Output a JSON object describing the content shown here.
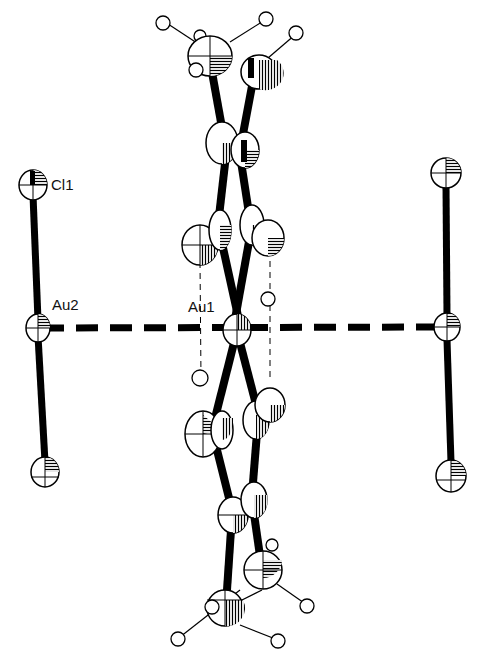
{
  "figure": {
    "type": "ORTEP crystal structure diagram",
    "background": "#ffffff",
    "ink": "#000000"
  },
  "labels": {
    "cl1": "Cl1",
    "au2": "Au2",
    "au1": "Au1"
  },
  "atoms": {
    "left_chain": [
      {
        "id": "Cl1",
        "x": 33,
        "y": 185
      },
      {
        "id": "Au2",
        "x": 38,
        "y": 328
      },
      {
        "id": "Cl-left-bottom",
        "x": 45,
        "y": 472
      }
    ],
    "right_chain": [
      {
        "id": "Cl-right-top",
        "x": 446,
        "y": 173
      },
      {
        "id": "Au-right",
        "x": 447,
        "y": 327
      },
      {
        "id": "Cl-right-bottom",
        "x": 451,
        "y": 476
      }
    ],
    "center": {
      "id": "Au1",
      "x": 237,
      "y": 330
    }
  },
  "bonds": {
    "aurophilic_dashed": {
      "from": "Au2",
      "to": "Au-right",
      "style": "heavy-dashed"
    }
  }
}
